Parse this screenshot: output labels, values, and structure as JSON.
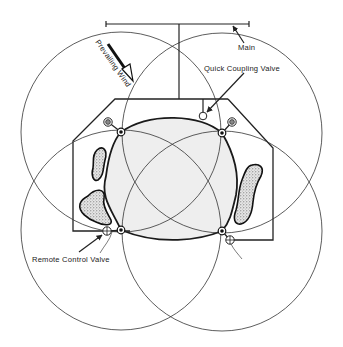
{
  "diagram": {
    "labels": {
      "main": "Main",
      "quick_coupling_valve": "Quick Coupling Valve",
      "prevailing_wind": "Prevailing Wind",
      "remote_control_valve": "Remote Control Valve"
    },
    "sprinklers": [
      {
        "id": "top-left",
        "position": "top-left"
      },
      {
        "id": "top-right",
        "position": "top-right"
      },
      {
        "id": "bottom-left",
        "position": "bottom-left"
      },
      {
        "id": "bottom-right",
        "position": "bottom-right"
      }
    ],
    "remote_control_valves": [
      {
        "id": "rcv-top-left"
      },
      {
        "id": "rcv-top-right"
      },
      {
        "id": "rcv-bottom-left"
      },
      {
        "id": "rcv-bottom-right"
      }
    ],
    "colors": {
      "line": "#222222",
      "lawn_fill": "#eeeeee",
      "bed_fill": "#9a9a9a",
      "background": "#ffffff"
    }
  }
}
